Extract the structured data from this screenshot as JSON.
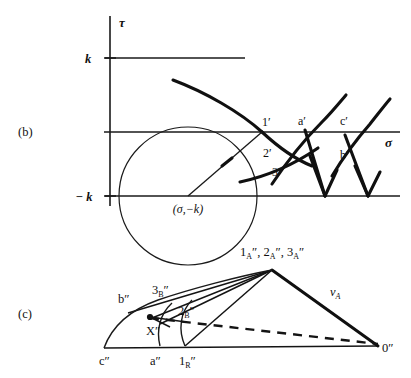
{
  "figure": {
    "panels": [
      {
        "tag": "(b)",
        "name": "mohr-circle-panel",
        "axes": {
          "vertical_label": "τ",
          "horizontal_label": "σ",
          "ticks": [
            {
              "label": "k",
              "value": "k"
            },
            {
              "label": "− k",
              "value": "-k"
            }
          ]
        },
        "circle_center_label": "(σ,−k)",
        "point_labels": [
          {
            "text": "1",
            "prime": "′"
          },
          {
            "text": "a",
            "prime": "′"
          },
          {
            "text": "c",
            "prime": "′"
          },
          {
            "text": "2",
            "prime": "′"
          },
          {
            "text": "3",
            "prime": "′"
          },
          {
            "text": "b",
            "prime": "′"
          }
        ]
      },
      {
        "tag": "(c)",
        "name": "hodograph-panel",
        "point_labels": [
          {
            "base": "1",
            "sub": "A",
            "prime": "″"
          },
          {
            "base": "2",
            "sub": "A",
            "prime": "″"
          },
          {
            "base": "3",
            "sub": "A",
            "prime": "″"
          },
          {
            "base": "3",
            "sub": "B",
            "prime": "″"
          },
          {
            "base": "2",
            "sub": "B",
            "prime": "″"
          },
          {
            "base": "1",
            "sub": "R",
            "prime": "″"
          },
          {
            "base": "b",
            "sub": "",
            "prime": "″"
          },
          {
            "base": "c",
            "sub": "",
            "prime": "″"
          },
          {
            "base": "a",
            "sub": "",
            "prime": "″"
          },
          {
            "base": "X",
            "sub": "",
            "prime": "″"
          },
          {
            "base": "0",
            "sub": "",
            "prime": "″"
          }
        ],
        "apex_label": "1ᴀ″, 2ᴀ″, 3ᴀ″",
        "velocity_label": {
          "base": "v",
          "sub": "A"
        }
      }
    ],
    "labels": {
      "panel_b_tag": "(b)",
      "panel_c_tag": "(c)",
      "tau": "τ",
      "sigma": "σ",
      "tick_k": "k",
      "tick_neg_k": "− k",
      "center": "(σ,−k)",
      "p1_prime": "1",
      "p1_prime_mark": "′",
      "pa_prime": "a",
      "pa_prime_mark": "′",
      "pc_prime": "c",
      "pc_prime_mark": "′",
      "p2_prime": "2",
      "p2_prime_mark": "′",
      "p3_prime": "3",
      "p3_prime_mark": "′",
      "pb_prime": "b",
      "pb_prime_mark": "′",
      "apex_1": "1",
      "apex_1_sub": "A",
      "apex_1_mark": "″",
      "apex_sep1": ", ",
      "apex_2": "2",
      "apex_2_sub": "A",
      "apex_2_mark": "″",
      "apex_sep2": ", ",
      "apex_3": "3",
      "apex_3_sub": "A",
      "apex_3_mark": "″",
      "l3b": "3",
      "l3b_sub": "B",
      "l3b_mark": "″",
      "l2b": "2",
      "l2b_sub": "B",
      "l2b_mark": "″",
      "l1r": "1",
      "l1r_sub": "R",
      "l1r_mark": "″",
      "lb2": "b",
      "lb2_mark": "″",
      "lc2": "c",
      "lc2_mark": "″",
      "la2": "a",
      "la2_mark": "″",
      "lx2": "X",
      "lx2_mark": "″",
      "l02": "0",
      "l02_mark": "″",
      "va": "v",
      "va_sub": "A"
    },
    "colors": {
      "ink": "#101010",
      "paper": "#ffffff"
    }
  }
}
